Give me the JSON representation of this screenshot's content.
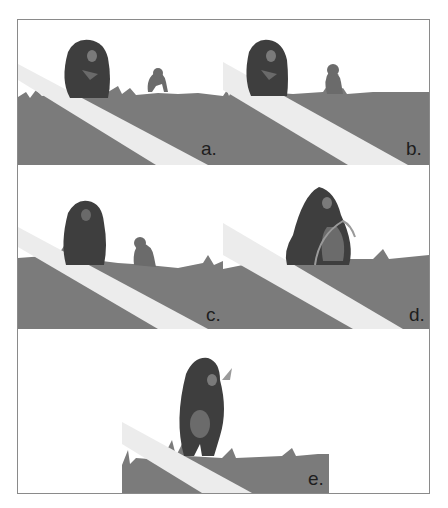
{
  "figure": {
    "panels": [
      {
        "id": "a",
        "label": "a.",
        "description": "Adult chimpanzee sitting holding object; juvenile at distance on grass"
      },
      {
        "id": "b",
        "label": "b.",
        "description": "Adult sitting; juvenile crouching closer"
      },
      {
        "id": "c",
        "label": "c.",
        "description": "Adult sitting in tall grass; juvenile approaching"
      },
      {
        "id": "d",
        "label": "d.",
        "description": "Adult and juvenile together with grass stem"
      },
      {
        "id": "e",
        "label": "e.",
        "description": "Adult standing, carrying juvenile on front, leaf held near head"
      }
    ]
  },
  "colors": {
    "ground": "#7b7b7b",
    "path": "#ececec",
    "adult": "#3e3e3e",
    "juvenile": "#6b6b6b",
    "face": "#8a8a8a",
    "border": "#8a8a8a",
    "label": "#1e1e1e"
  }
}
